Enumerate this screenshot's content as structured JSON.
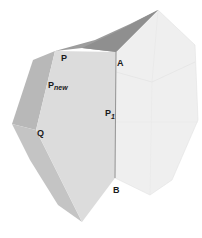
{
  "figure": {
    "colors": {
      "background": "#ffffff",
      "right_face": "#efefef",
      "front_face": "#dcdcdc",
      "side_face": "#b8b8b8",
      "top_face": "#9d9d9d",
      "lower_side_face": "#c4c4c4",
      "edge": "#d6d6d6",
      "seam": "#8a8a8a",
      "label": "#1a1a1a"
    },
    "labels": {
      "P": "P",
      "P_new_main": "P",
      "P_new_sub": "new",
      "A": "A",
      "P1_main": "P",
      "P1_sub": "1",
      "Q": "Q",
      "B": "B"
    }
  }
}
